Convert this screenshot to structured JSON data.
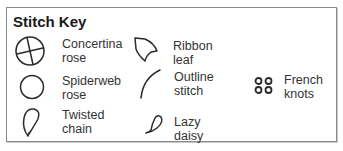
{
  "key": {
    "title": "Stitch Key",
    "items": [
      {
        "name": "Concertina rose",
        "label": "Concertina\nrose",
        "icon": "circle-cross-icon"
      },
      {
        "name": "Ribbon leaf",
        "label": "Ribbon leaf",
        "icon": "ribbon-leaf-icon"
      },
      {
        "name": "Spiderweb rose",
        "label": "Spiderweb\nrose",
        "icon": "circle-icon"
      },
      {
        "name": "Outline stitch",
        "label": "Outline\nstitch",
        "icon": "curve-line-icon"
      },
      {
        "name": "French knots",
        "label": "French\nknots",
        "icon": "four-dots-icon"
      },
      {
        "name": "Twisted chain",
        "label": "Twisted\nchain",
        "icon": "teardrop-loop-icon"
      },
      {
        "name": "Lazy daisy",
        "label": "Lazy daisy",
        "icon": "petal-icon"
      }
    ]
  },
  "colors": {
    "border": "#8a8a8a",
    "text": "#333333",
    "stroke": "#2a2a2a"
  }
}
